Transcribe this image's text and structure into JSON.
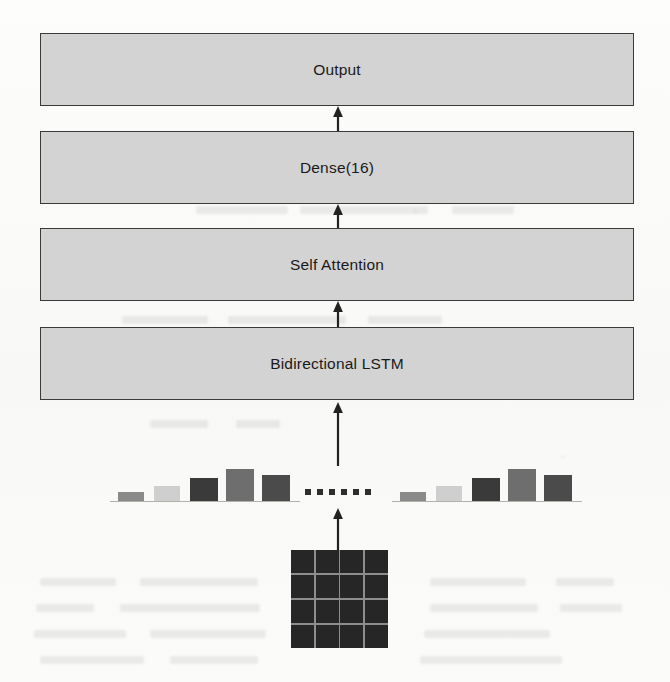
{
  "figure": {
    "background_color": "#fbfbfa",
    "width": 670,
    "height": 682
  },
  "layers": [
    {
      "id": "output",
      "label": "Output",
      "x": 40,
      "y": 33,
      "width": 594,
      "height": 73,
      "fill": "#d3d3d3",
      "stroke": "#3a3a3a"
    },
    {
      "id": "dense",
      "label": "Dense(16)",
      "x": 40,
      "y": 131,
      "width": 594,
      "height": 73,
      "fill": "#d3d3d3",
      "stroke": "#3a3a3a"
    },
    {
      "id": "self-attention",
      "label": "Self Attention",
      "x": 40,
      "y": 228,
      "width": 594,
      "height": 73,
      "fill": "#d3d3d3",
      "stroke": "#3a3a3a"
    },
    {
      "id": "bidirectional-lstm",
      "label": "Bidirectional LSTM",
      "x": 40,
      "y": 327,
      "width": 594,
      "height": 73,
      "fill": "#d3d3d3",
      "stroke": "#3a3a3a"
    }
  ],
  "arrows": [
    {
      "id": "dense-to-output",
      "x": 338,
      "y_top": 106,
      "y_bottom": 131,
      "color": "#222222"
    },
    {
      "id": "attention-to-dense",
      "x": 338,
      "y_top": 204,
      "y_bottom": 228,
      "color": "#222222"
    },
    {
      "id": "lstm-to-attention",
      "x": 338,
      "y_top": 301,
      "y_bottom": 327,
      "color": "#222222"
    },
    {
      "id": "embeddings-to-lstm",
      "x": 338,
      "y_top": 402,
      "y_bottom": 466,
      "color": "#222222"
    },
    {
      "id": "input-grid-to-embeddings",
      "x": 338,
      "y_top": 508,
      "y_bottom": 550,
      "color": "#222222"
    }
  ],
  "embeddings": {
    "baseline_y": 501,
    "groups": [
      {
        "id": "left-group",
        "x": 118,
        "bars": [
          {
            "x": 118,
            "width": 26,
            "height": 9,
            "color": "#8a8a8a"
          },
          {
            "x": 154,
            "width": 26,
            "height": 15,
            "color": "#cfcfcf"
          },
          {
            "x": 190,
            "width": 28,
            "height": 23,
            "color": "#3a3a3a"
          },
          {
            "x": 226,
            "width": 28,
            "height": 32,
            "color": "#6e6e6e"
          },
          {
            "x": 262,
            "width": 28,
            "height": 26,
            "color": "#4b4b4b"
          }
        ]
      },
      {
        "id": "right-group",
        "x": 400,
        "bars": [
          {
            "x": 400,
            "width": 26,
            "height": 9,
            "color": "#8a8a8a"
          },
          {
            "x": 436,
            "width": 26,
            "height": 15,
            "color": "#cfcfcf"
          },
          {
            "x": 472,
            "width": 28,
            "height": 23,
            "color": "#3a3a3a"
          },
          {
            "x": 508,
            "width": 28,
            "height": 32,
            "color": "#6e6e6e"
          },
          {
            "x": 544,
            "width": 28,
            "height": 26,
            "color": "#4b4b4b"
          }
        ]
      }
    ],
    "ellipsis": {
      "count": 6,
      "y": 489,
      "start_x": 305,
      "spacing": 12,
      "color": "#2e2e2e"
    }
  },
  "input_grid": {
    "id": "input-matrix",
    "x": 291,
    "y": 550,
    "width": 97,
    "height": 98,
    "rows": 4,
    "columns": 4,
    "cell_color": "#262626",
    "line_color": "#8d8d8d"
  },
  "background_ghost_text": [
    {
      "x": 196,
      "y": 206,
      "width": 92
    },
    {
      "x": 300,
      "y": 206,
      "width": 128
    },
    {
      "x": 452,
      "y": 206,
      "width": 62
    },
    {
      "x": 182,
      "y": 232,
      "width": 142
    },
    {
      "x": 338,
      "y": 232,
      "width": 96
    },
    {
      "x": 122,
      "y": 316,
      "width": 86
    },
    {
      "x": 228,
      "y": 316,
      "width": 118
    },
    {
      "x": 368,
      "y": 316,
      "width": 74
    },
    {
      "x": 150,
      "y": 420,
      "width": 58
    },
    {
      "x": 236,
      "y": 420,
      "width": 44
    },
    {
      "x": 40,
      "y": 578,
      "width": 76
    },
    {
      "x": 140,
      "y": 578,
      "width": 118
    },
    {
      "x": 430,
      "y": 578,
      "width": 96
    },
    {
      "x": 556,
      "y": 578,
      "width": 58
    },
    {
      "x": 36,
      "y": 604,
      "width": 58
    },
    {
      "x": 120,
      "y": 604,
      "width": 140
    },
    {
      "x": 430,
      "y": 604,
      "width": 108
    },
    {
      "x": 560,
      "y": 604,
      "width": 62
    },
    {
      "x": 34,
      "y": 630,
      "width": 92
    },
    {
      "x": 150,
      "y": 630,
      "width": 116
    },
    {
      "x": 424,
      "y": 630,
      "width": 126
    },
    {
      "x": 40,
      "y": 656,
      "width": 104
    },
    {
      "x": 170,
      "y": 656,
      "width": 88
    },
    {
      "x": 420,
      "y": 656,
      "width": 142
    }
  ]
}
